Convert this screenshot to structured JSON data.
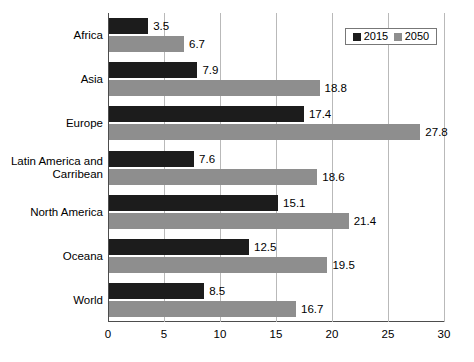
{
  "chart_data": {
    "type": "bar",
    "orientation": "horizontal",
    "title": "",
    "xlabel": "",
    "ylabel": "",
    "xlim": [
      0,
      30
    ],
    "xticks": [
      0,
      5,
      10,
      15,
      20,
      25,
      30
    ],
    "xtick_labels": [
      "0",
      "5",
      "10",
      "15",
      "20",
      "25",
      "30"
    ],
    "grid": true,
    "grid_axis": "x",
    "legend_position": "top-right",
    "categories": [
      "Africa",
      "Asia",
      "Europe",
      "Latin America and Carribean",
      "North America",
      "Oceana",
      "World"
    ],
    "category_lines": [
      [
        "Africa"
      ],
      [
        "Asia"
      ],
      [
        "Europe"
      ],
      [
        "Latin America and",
        "Carribean"
      ],
      [
        "North America"
      ],
      [
        "Oceana"
      ],
      [
        "World"
      ]
    ],
    "series": [
      {
        "name": "2015",
        "color": "#1c1c1c",
        "values": [
          3.5,
          7.9,
          17.4,
          7.6,
          15.1,
          12.5,
          8.5
        ],
        "value_labels": [
          "3.5",
          "7.9",
          "17.4",
          "7.6",
          "15.1",
          "12.5",
          "8.5"
        ]
      },
      {
        "name": "2050",
        "color": "#8e8e8e",
        "values": [
          6.7,
          18.8,
          27.8,
          18.6,
          21.4,
          19.5,
          16.7
        ],
        "value_labels": [
          "6.7",
          "18.8",
          "27.8",
          "18.6",
          "21.4",
          "19.5",
          "16.7"
        ]
      }
    ]
  },
  "legend": {
    "items": [
      {
        "label": "2015",
        "color": "#1c1c1c"
      },
      {
        "label": "2050",
        "color": "#8e8e8e"
      }
    ]
  },
  "colors": {
    "series_2015": "#1c1c1c",
    "series_2050": "#8e8e8e",
    "gridline": "#b9b9b9",
    "axis": "#4d4d4d",
    "background": "#ffffff"
  }
}
